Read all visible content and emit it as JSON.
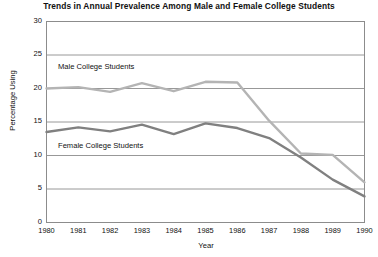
{
  "chart_data": {
    "type": "line",
    "title": "Trends in Annual Prevalence Among Male and Female College Students",
    "xlabel": "Year",
    "ylabel": "Percentage Using",
    "x": [
      1980,
      1981,
      1982,
      1983,
      1984,
      1985,
      1986,
      1987,
      1988,
      1989,
      1990
    ],
    "xticklabels": [
      "1980",
      "1981",
      "1982",
      "1983",
      "1984",
      "1985",
      "1986",
      "1987",
      "1988",
      "1989",
      "1990"
    ],
    "yticklabels": [
      "0",
      "5",
      "10",
      "15",
      "20",
      "25",
      "30"
    ],
    "yticks": [
      0,
      5,
      10,
      15,
      20,
      25,
      30
    ],
    "ylim": [
      0,
      30
    ],
    "xlim": [
      1980,
      1990
    ],
    "grid": "horizontal",
    "legend": "inline-labels",
    "series": [
      {
        "name": "Male College Students",
        "color": "#b4b4b4",
        "values": [
          20.0,
          20.2,
          19.5,
          20.8,
          19.6,
          21.0,
          20.9,
          15.2,
          10.3,
          10.1,
          6.0
        ]
      },
      {
        "name": "Female College Students",
        "color": "#808080",
        "values": [
          13.5,
          14.2,
          13.6,
          14.6,
          13.2,
          14.8,
          14.1,
          12.6,
          9.7,
          6.4,
          3.9
        ]
      }
    ]
  },
  "labels": {
    "male_series_label": "Male College Students",
    "female_series_label": "Female College Students"
  }
}
